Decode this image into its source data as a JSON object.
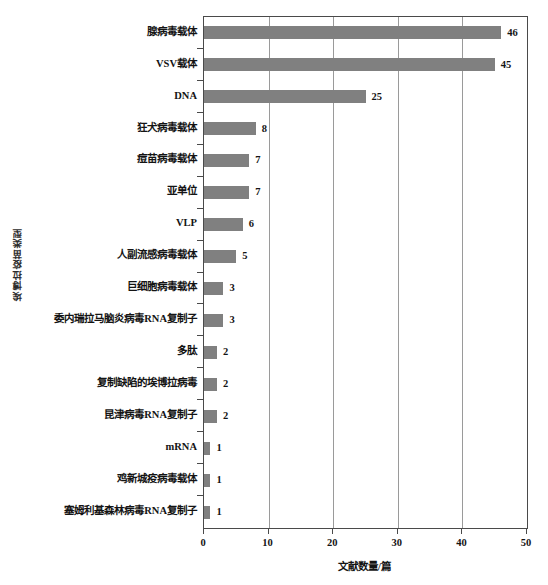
{
  "chart_data": {
    "type": "bar",
    "orientation": "horizontal",
    "title": "",
    "xlabel": "文献数量/篇",
    "ylabel": "埃博拉疫苗类型",
    "xlim": [
      0,
      50
    ],
    "xticks": [
      0,
      10,
      20,
      30,
      40,
      50
    ],
    "grid": "vertical",
    "legend": "none",
    "bar_color": "#808080",
    "axis_color": "#4a4a4a",
    "gridline_color": "#9a9a9a",
    "categories": [
      "腺病毒载体",
      "VSV载体",
      "DNA",
      "狂犬病毒载体",
      "痘苗病毒载体",
      "亚单位",
      "VLP",
      "人副流感病毒载体",
      "巨细胞病毒载体",
      "委内瑞拉马脑炎病毒RNA复制子",
      "多肽",
      "复制缺陷的埃博拉病毒",
      "昆津病毒RNA复制子",
      "mRNA",
      "鸡新城疫病毒载体",
      "塞姆利基森林病毒RNA复制子"
    ],
    "values": [
      46,
      45,
      25,
      8,
      7,
      7,
      6,
      5,
      3,
      3,
      2,
      2,
      2,
      1,
      1,
      1
    ],
    "value_labels": [
      "46",
      "45",
      "25",
      "8",
      "7",
      "7",
      "6",
      "5",
      "3",
      "3",
      "2",
      "2",
      "2",
      "1",
      "1",
      "1"
    ]
  }
}
